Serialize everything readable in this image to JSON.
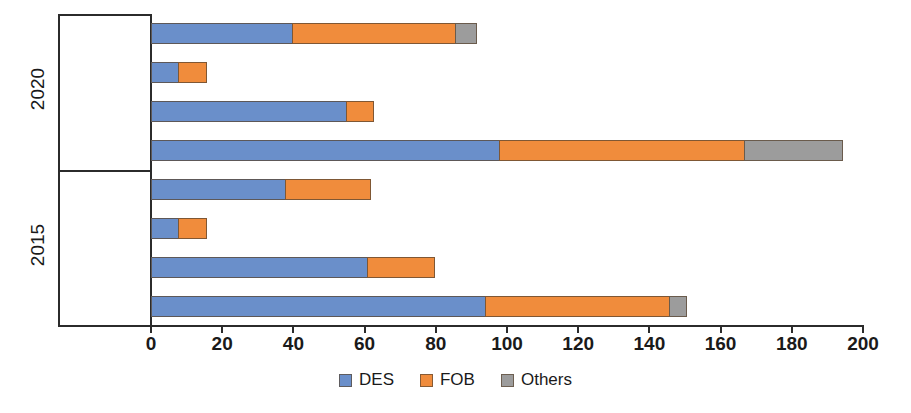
{
  "chart_data": {
    "type": "bar",
    "orientation": "horizontal",
    "stacked": true,
    "title": "",
    "xlabel": "",
    "ylabel": "",
    "xlim": [
      0,
      200
    ],
    "xticks": [
      0,
      20,
      40,
      60,
      80,
      100,
      120,
      140,
      160,
      180,
      200
    ],
    "grid": false,
    "legend_position": "bottom",
    "series": [
      {
        "name": "DES",
        "color": "#6A8FCA"
      },
      {
        "name": "FOB",
        "color": "#F08C3C"
      },
      {
        "name": "Others",
        "color": "#9C9C9C"
      }
    ],
    "groups": [
      {
        "label": "2020",
        "categories": [
          "Portfolio",
          "Others",
          "Europe",
          "Asia"
        ],
        "rows": [
          {
            "category": "Portfolio",
            "DES": 40,
            "FOB": 46,
            "Others": 6,
            "total": 92
          },
          {
            "category": "Others",
            "DES": 8,
            "FOB": 8,
            "Others": 0,
            "total": 16
          },
          {
            "category": "Europe",
            "DES": 55,
            "FOB": 8,
            "Others": 0,
            "total": 63
          },
          {
            "category": "Asia",
            "DES": 98,
            "FOB": 69,
            "Others": 28,
            "total": 195
          }
        ]
      },
      {
        "label": "2015",
        "categories": [
          "Portfolio",
          "Others",
          "Europe",
          "Asia"
        ],
        "rows": [
          {
            "category": "Portfolio",
            "DES": 38,
            "FOB": 24,
            "Others": 0,
            "total": 62
          },
          {
            "category": "Others",
            "DES": 8,
            "FOB": 8,
            "Others": 0,
            "total": 16
          },
          {
            "category": "Europe",
            "DES": 61,
            "FOB": 19,
            "Others": 0,
            "total": 80
          },
          {
            "category": "Asia",
            "DES": 94,
            "FOB": 52,
            "Others": 5,
            "total": 151
          }
        ]
      }
    ]
  },
  "legend": {
    "items": [
      {
        "label": "DES",
        "color": "#6A8FCA"
      },
      {
        "label": "FOB",
        "color": "#F08C3C"
      },
      {
        "label": "Others",
        "color": "#9C9C9C"
      }
    ]
  }
}
